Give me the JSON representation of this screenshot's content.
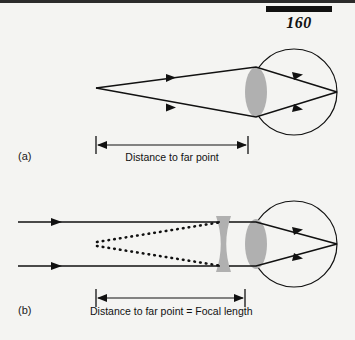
{
  "page": {
    "number": "160",
    "background_color": "#f4f4f2",
    "ink_color": "#111111"
  },
  "figure": {
    "panels": [
      {
        "id": "a",
        "label": "(a)",
        "caption": "Distance to far point",
        "description": "Uncorrected nearsighted eye focusing light from the far point onto the retina",
        "measure": {
          "start_x": 96,
          "end_x": 248,
          "y": 145
        },
        "eye": {
          "cx": 294,
          "cy": 92,
          "r": 43,
          "lens_color": "#b0b0b0",
          "lens_type": "convex",
          "lens_cx": 256,
          "lens_cy": 92,
          "lens_rx": 11,
          "lens_ry": 25
        },
        "rays": {
          "source_x": 96,
          "source_y": 88,
          "focus_x": 337,
          "focus_y": 92,
          "count": 2
        }
      },
      {
        "id": "b",
        "label": "(b)",
        "caption": "Distance to far point = Focal length",
        "description": "Nearsighted eye corrected with a diverging lens; parallel rays appear to come from the far point",
        "measure": {
          "start_x": 96,
          "end_x": 245,
          "y": 298
        },
        "eye": {
          "cx": 294,
          "cy": 244,
          "r": 43,
          "lens_color": "#b0b0b0",
          "lens_type": "convex",
          "lens_cx": 256,
          "lens_cy": 244,
          "lens_rx": 11,
          "lens_ry": 25
        },
        "corrective_lens": {
          "type": "concave",
          "x": 216,
          "y": 216,
          "width": 15,
          "height": 56,
          "color": "#b0b0b0"
        },
        "rays": {
          "incoming_parallel_y": [
            222,
            266
          ],
          "incoming_start_x": 18,
          "virtual_focus_x": 97,
          "virtual_focus_y": 244,
          "focus_x": 337,
          "focus_y": 244,
          "count": 2,
          "virtual_ray_style": "dotted"
        }
      }
    ]
  }
}
